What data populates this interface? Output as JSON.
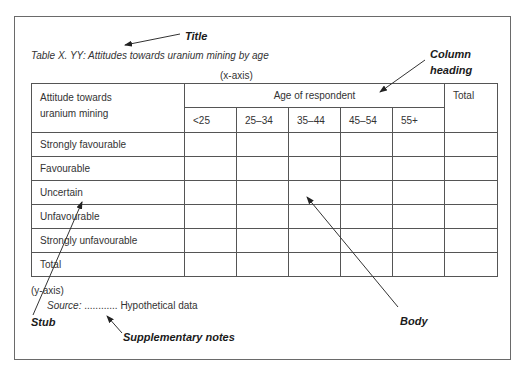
{
  "annotations": {
    "title": "Title",
    "column_heading_line1": "Column",
    "column_heading_line2": "heading",
    "stub": "Stub",
    "body": "Body",
    "supplementary_notes": "Supplementary notes"
  },
  "caption": "Table X. YY: Attitudes towards uranium mining by age",
  "x_axis_label": "(x-axis)",
  "y_axis_label": "(y-axis)",
  "source": {
    "label": "Source:",
    "dots": "............",
    "text": "Hypothetical data"
  },
  "table": {
    "stub_header_line1": "Attitude towards",
    "stub_header_line2": "uranium mining",
    "spanner_header": "Age of respondent",
    "total_header": "Total",
    "age_groups": [
      "<25",
      "25–34",
      "35–44",
      "45–54",
      "55+"
    ],
    "rows": [
      "Strongly favourable",
      "Favourable",
      "Uncertain",
      "Unfavourable",
      "Strongly unfavourable",
      "Total"
    ]
  },
  "colors": {
    "lines": "#555555",
    "frame": "#6a6a6a",
    "text": "#333333"
  }
}
